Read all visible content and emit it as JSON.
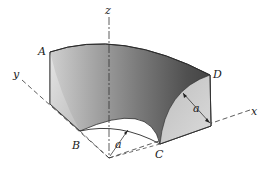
{
  "diagram": {
    "type": "3d-solid-figure",
    "axes": {
      "x": "x",
      "y": "y",
      "z": "z"
    },
    "points": {
      "A": "A",
      "B": "B",
      "C": "C",
      "D": "D"
    },
    "dimensions": {
      "radius_label": "a",
      "thickness_label": "a"
    },
    "colors": {
      "background": "#ffffff",
      "outer_face_dark": "#4a4a4a",
      "outer_face_mid": "#8a8a8a",
      "left_face": "#c8c8c8",
      "right_face": "#d2d2d2",
      "axis_line": "#333333"
    }
  }
}
